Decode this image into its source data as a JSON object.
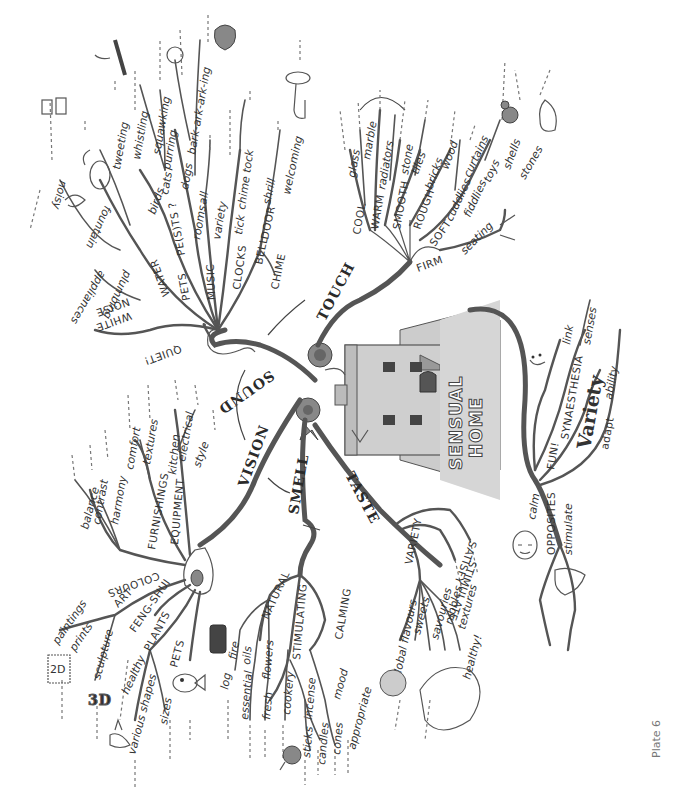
{
  "title": "Sensual Home",
  "plate_label": "Plate 6",
  "central": {
    "line1": "SENSUAL",
    "line2": "HOME"
  },
  "main_branches": {
    "sound": "SOUND",
    "touch": "TOUCH",
    "vision": "VISION",
    "smell": "SMELL",
    "taste": "TASTE"
  },
  "sound": {
    "quiet": "QUIET!",
    "white": "WHITE",
    "noise": "NOISE",
    "appliances": "appliances",
    "noisy": "noisy",
    "water": "WATER",
    "plumbing": "plumbing",
    "fountain": "fountain",
    "pets": "PETS",
    "pests": "PE(S)TS ?",
    "birds": "birds",
    "tweeting": "tweeting",
    "whistling": "whistling",
    "squawking": "squawking",
    "cats": "cats",
    "purring": "purring",
    "dogs": "dogs",
    "barking": "bark-ark-ark-ing",
    "music": "MUSIC",
    "rooms": "rooms",
    "all": "all",
    "variety": "variety",
    "clocks": "CLOCKS",
    "tick": "tick",
    "chime_tock": "chime tock",
    "door": "DOOR",
    "bell": "BELL",
    "chime": "CHIME",
    "shrill": "shrill",
    "welcoming": "welcoming"
  },
  "touch": {
    "cool": "COOL",
    "glass": "glass",
    "marble": "marble",
    "warm": "WARM",
    "radiators": "radiators",
    "smooth": "SMOOTH",
    "stone": "stone",
    "tiles": "tiles",
    "rough": "ROUGH",
    "bricks": "bricks",
    "wood": "wood",
    "soft": "SOFT",
    "cuddlies": "cuddlies",
    "curtains": "curtains",
    "fiddlies": "fiddlies",
    "toys": "toys",
    "shells": "shells",
    "stones": "stones",
    "firm": "FIRM",
    "seating": "seating"
  },
  "vision": {
    "colours": "COLOURS",
    "balance": "balance",
    "contrast": "contrast",
    "harmony": "harmony",
    "furnishings": "FURNISHINGS",
    "comfort": "comfort",
    "textures": "textures",
    "equipment": "EQUIPMENT",
    "kitchen": "kitchen",
    "electrical": "electrical",
    "style": "style",
    "art": "ART",
    "paintings": "paintings",
    "prints": "prints",
    "sculpture": "sculpture",
    "two_d": "2D",
    "three_d": "3D",
    "feng_shui": "FENG-SHUI",
    "plants": "PLANTS",
    "healthy": "healthy",
    "various_shapes": "various shapes",
    "sizes": "sizes",
    "pets": "PETS"
  },
  "smell": {
    "natural": "NATURAL",
    "log": "log",
    "fire": "fire",
    "essential": "essential",
    "oils": "oils",
    "fresh": "fresh",
    "flowers": "flowers",
    "stimulating": "STIMULATING",
    "cookery": "cookery",
    "incense": "incense",
    "sticks": "sticks",
    "candles": "candles",
    "cones": "cones",
    "calming": "CALMING",
    "mood": "mood",
    "appropriate": "appropriate"
  },
  "taste": {
    "variety": "VARIETY",
    "stimulate": "STIMULATE",
    "satisfy": "SATISFY",
    "global_flavours": "global flavours",
    "sweets": "sweets",
    "savouries": "savouries",
    "nibbles": "nibbles",
    "textures": "textures",
    "healthy": "healthy!"
  },
  "home_branch": {
    "fun": "FUN!",
    "synaesthesia": "SYNAESTHESIA",
    "link": "link",
    "senses": "senses",
    "variety": "Variety",
    "adapt": "adapt",
    "ability": "ability",
    "opposites": "OPPOSITES",
    "calm": "calm",
    "stimulate": "stimulate"
  },
  "icons": [
    "speaker-icon",
    "fountain-icon",
    "tornado-icon",
    "bird-icon",
    "cat-icon",
    "dog-icon",
    "doorbell-hand-icon",
    "clock-icon",
    "hand-icon",
    "teddy-bear-icon",
    "shell-icon",
    "chair-icon",
    "eye-icon",
    "stamp-2d-icon",
    "fish-icon",
    "plant-icon",
    "log-fire-icon",
    "apple-icon",
    "globe-icon",
    "mouth-icon",
    "house-icon",
    "rose-icon",
    "face-calm-icon",
    "pointing-hand-icon"
  ]
}
